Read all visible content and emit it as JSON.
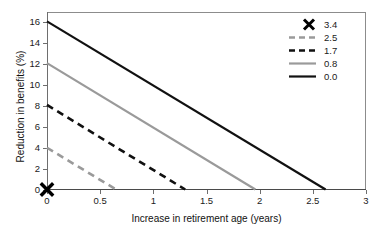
{
  "chart_data": {
    "type": "line",
    "title": "",
    "xlabel": "Increase in retirement age (years)",
    "ylabel": "Reduction in benefits (%)",
    "xlim": [
      0,
      3
    ],
    "ylim": [
      0,
      17
    ],
    "grid": false,
    "legend_position": "top-right",
    "xticks": [
      "0",
      "0.5",
      "1",
      "1.5",
      "2",
      "2.5",
      "3"
    ],
    "xtick_values": [
      0,
      0.5,
      1,
      1.5,
      2,
      2.5,
      3
    ],
    "yticks": [
      "0",
      "2",
      "4",
      "6",
      "8",
      "10",
      "12",
      "14",
      "16"
    ],
    "ytick_values": [
      0,
      2,
      4,
      6,
      8,
      10,
      12,
      14,
      16
    ],
    "series": [
      {
        "name": "3.4",
        "style": "marker",
        "marker": "x",
        "color": "#000000",
        "x": [
          0
        ],
        "y": [
          0
        ]
      },
      {
        "name": "2.5",
        "style": "dashed",
        "color": "#9a9a9a",
        "x": [
          0,
          0.65
        ],
        "y": [
          4.0,
          0
        ]
      },
      {
        "name": "1.7",
        "style": "dashed",
        "color": "#111111",
        "x": [
          0,
          1.3
        ],
        "y": [
          8.1,
          0
        ]
      },
      {
        "name": "0.8",
        "style": "solid",
        "color": "#9a9a9a",
        "x": [
          0,
          1.96
        ],
        "y": [
          12.1,
          0
        ]
      },
      {
        "name": "0.0",
        "style": "solid",
        "color": "#111111",
        "x": [
          0,
          2.62
        ],
        "y": [
          16.1,
          0
        ]
      }
    ],
    "legend_entries": [
      {
        "label": "3.4",
        "style": "marker",
        "color": "#000000"
      },
      {
        "label": "2.5",
        "style": "dashed",
        "color": "#9a9a9a"
      },
      {
        "label": "1.7",
        "style": "dashed",
        "color": "#111111"
      },
      {
        "label": "0.8",
        "style": "solid",
        "color": "#9a9a9a"
      },
      {
        "label": "0.0",
        "style": "solid",
        "color": "#111111"
      }
    ]
  }
}
